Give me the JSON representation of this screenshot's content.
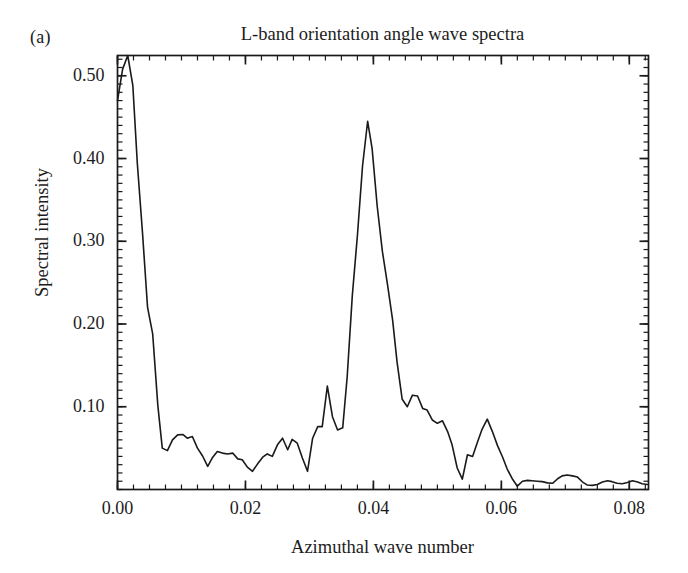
{
  "figure": {
    "panel_label": "(a)",
    "title": "L-band orientation angle wave spectra",
    "xlabel": "Azimuthal wave number",
    "ylabel": "Spectral intensity",
    "line_color": "#1a1a1a",
    "axis_color": "#1a1a1a",
    "background": "#ffffff"
  },
  "chart_data": {
    "type": "line",
    "title": "L-band orientation angle wave spectra",
    "subtitle": "(a)",
    "xlabel": "Azimuthal wave number",
    "ylabel": "Spectral intensity",
    "xlim": [
      0.0,
      0.083
    ],
    "ylim": [
      0.0,
      0.5245
    ],
    "xticks": [
      0.0,
      0.02,
      0.04,
      0.06,
      0.08
    ],
    "xtick_labels": [
      "0.00",
      "0.02",
      "0.04",
      "0.06",
      "0.08"
    ],
    "yticks": [
      0.1,
      0.2,
      0.3,
      0.4,
      0.5
    ],
    "ytick_labels": [
      "0.10",
      "0.20",
      "0.30",
      "0.40",
      "0.50"
    ],
    "x_minor_tick_interval": 0.0025,
    "y_minor_tick_interval": 0.01,
    "grid": false,
    "legend": null,
    "ticks_direction": "in",
    "series": [
      {
        "name": "L-band orientation angle spectrum",
        "color": "#1a1a1a",
        "linewidth": 1.6,
        "x": [
          0.0,
          0.0008,
          0.0016,
          0.0024,
          0.0031,
          0.0039,
          0.0047,
          0.0055,
          0.0063,
          0.007,
          0.0078,
          0.0086,
          0.0094,
          0.0102,
          0.0109,
          0.0117,
          0.0125,
          0.0133,
          0.0141,
          0.0148,
          0.0156,
          0.0164,
          0.0172,
          0.018,
          0.0188,
          0.0195,
          0.0203,
          0.0211,
          0.0219,
          0.0227,
          0.0234,
          0.0242,
          0.025,
          0.0258,
          0.0266,
          0.0273,
          0.0281,
          0.0289,
          0.0297,
          0.0305,
          0.0313,
          0.032,
          0.0328,
          0.0336,
          0.0344,
          0.0352,
          0.0359,
          0.0367,
          0.0375,
          0.0383,
          0.0391,
          0.0398,
          0.0406,
          0.0414,
          0.0422,
          0.043,
          0.0437,
          0.0445,
          0.0453,
          0.0461,
          0.0469,
          0.0477,
          0.0484,
          0.0492,
          0.05,
          0.0508,
          0.0516,
          0.0523,
          0.0531,
          0.0539,
          0.0547,
          0.0555,
          0.0563,
          0.057,
          0.0578,
          0.0586,
          0.0594,
          0.0602,
          0.0609,
          0.0617,
          0.0625,
          0.0633,
          0.0641,
          0.0648,
          0.0656,
          0.0664,
          0.0672,
          0.068,
          0.0688,
          0.0695,
          0.0703,
          0.0711,
          0.0719,
          0.0727,
          0.0734,
          0.0742,
          0.075,
          0.0758,
          0.0766,
          0.0773,
          0.0781,
          0.0789,
          0.0797,
          0.0805,
          0.0813,
          0.082,
          0.0828
        ],
        "y": [
          0.47,
          0.508,
          0.5245,
          0.488,
          0.394,
          0.311,
          0.22,
          0.188,
          0.102,
          0.05,
          0.047,
          0.06,
          0.066,
          0.0665,
          0.062,
          0.064,
          0.05,
          0.0405,
          0.028,
          0.038,
          0.046,
          0.044,
          0.043,
          0.044,
          0.037,
          0.036,
          0.027,
          0.022,
          0.031,
          0.039,
          0.043,
          0.04,
          0.054,
          0.062,
          0.048,
          0.0605,
          0.056,
          0.038,
          0.022,
          0.062,
          0.076,
          0.076,
          0.125,
          0.088,
          0.072,
          0.0745,
          0.136,
          0.234,
          0.307,
          0.391,
          0.445,
          0.412,
          0.342,
          0.288,
          0.248,
          0.205,
          0.154,
          0.109,
          0.1,
          0.114,
          0.113,
          0.098,
          0.096,
          0.084,
          0.08,
          0.083,
          0.07,
          0.054,
          0.026,
          0.0125,
          0.042,
          0.04,
          0.058,
          0.073,
          0.085,
          0.07,
          0.053,
          0.039,
          0.025,
          0.013,
          0.004,
          0.01,
          0.011,
          0.0105,
          0.01,
          0.0095,
          0.008,
          0.0075,
          0.013,
          0.0165,
          0.0175,
          0.0165,
          0.015,
          0.009,
          0.0055,
          0.005,
          0.006,
          0.009,
          0.0105,
          0.0095,
          0.0075,
          0.007,
          0.0085,
          0.0105,
          0.009,
          0.007,
          0.006
        ]
      }
    ]
  }
}
